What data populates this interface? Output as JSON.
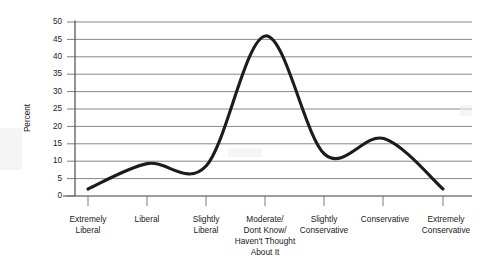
{
  "chart_data": {
    "type": "line",
    "title": "",
    "xlabel": "",
    "ylabel": "Percent",
    "ylim": [
      0,
      50
    ],
    "ytick_step": 5,
    "grid": true,
    "legend": "none",
    "categories": [
      "Extremely Liberal",
      "Liberal",
      "Slightly Liberal",
      "Moderate/ Dont Know/ Haven't Thought About It",
      "Slightly Conservative",
      "Conservative",
      "Extremely Conservative"
    ],
    "values": [
      2,
      9.3,
      8.7,
      46,
      12,
      16.5,
      2
    ],
    "series": [
      {
        "name": "Percent",
        "values": [
          2,
          9.3,
          8.7,
          46,
          12,
          16.5,
          2
        ]
      }
    ],
    "ytick_labels": [
      "0",
      "5",
      "10",
      "15",
      "20",
      "25",
      "30",
      "35",
      "40",
      "45",
      "50"
    ],
    "xtick_labels": [
      [
        "Extremely",
        "Liberal"
      ],
      [
        "Liberal"
      ],
      [
        "Slightly",
        "Liberal"
      ],
      [
        "Moderate/",
        "Dont Know/",
        "Haven't Thought",
        "About It"
      ],
      [
        "Slightly",
        "Conservative"
      ],
      [
        "Conservative"
      ],
      [
        "Extremely",
        "Conservative"
      ]
    ],
    "colors": {
      "curve": "#1c1c1c",
      "grid": "#7b7b7b",
      "axis": "#3c3c3c",
      "background": "#ffffff",
      "text": "#1a1a1a"
    }
  },
  "axis": {
    "y_title": "Percent",
    "y_ticks": [
      {
        "label": "50"
      },
      {
        "label": "45"
      },
      {
        "label": "40"
      },
      {
        "label": "35"
      },
      {
        "label": "30"
      },
      {
        "label": "25"
      },
      {
        "label": "20"
      },
      {
        "label": "15"
      },
      {
        "label": "10"
      },
      {
        "label": "5"
      },
      {
        "label": "0"
      }
    ]
  },
  "xlabels": {
    "c0": {
      "l0": "Extremely",
      "l1": "Liberal"
    },
    "c1": {
      "l0": "Liberal"
    },
    "c2": {
      "l0": "Slightly",
      "l1": "Liberal"
    },
    "c3": {
      "l0": "Moderate/",
      "l1": "Dont Know/",
      "l2": "Haven't Thought",
      "l3": "About It"
    },
    "c4": {
      "l0": "Slightly",
      "l1": "Conservative"
    },
    "c5": {
      "l0": "Conservative"
    },
    "c6": {
      "l0": "Extremely",
      "l1": "Conservative"
    }
  }
}
